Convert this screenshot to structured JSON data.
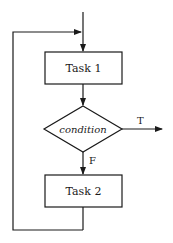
{
  "diagram": {
    "type": "flowchart",
    "nodes": {
      "task1": {
        "label": "Task 1",
        "shape": "rectangle"
      },
      "condition": {
        "label": "condition",
        "shape": "diamond"
      },
      "task2": {
        "label": "Task 2",
        "shape": "rectangle"
      }
    },
    "edges": {
      "true_label": "T",
      "false_label": "F"
    },
    "colors": {
      "stroke": "#1a1a1a",
      "background": "#ffffff"
    }
  }
}
